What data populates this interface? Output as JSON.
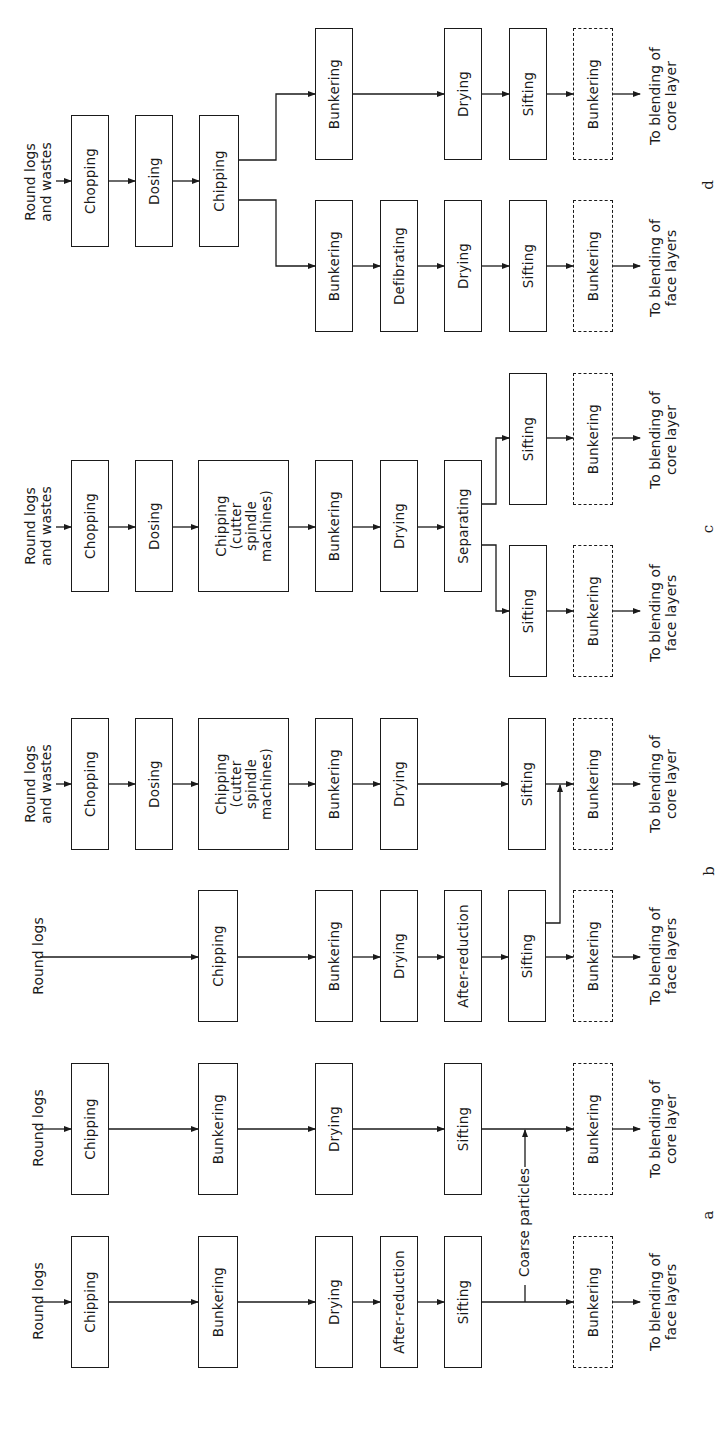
{
  "figure": {
    "orientation": "rotated 90 degrees counter-clockwise",
    "panels": [
      {
        "id": "a",
        "label": "a",
        "lanes": [
          {
            "input": "Round logs",
            "steps": [
              "Chipping",
              "Bunkering",
              "Drying",
              "Sifting",
              "Bunkering"
            ],
            "output": "To blending of core layer"
          },
          {
            "input": "Round logs",
            "steps": [
              "Chipping",
              "Bunkering",
              "Drying",
              "After-reduction",
              "Sifting",
              "Bunkering"
            ],
            "output": "To blending of face layers"
          }
        ],
        "annotation": "Coarse particles"
      },
      {
        "id": "b",
        "label": "b",
        "lanes": [
          {
            "input": "Round logs and wastes",
            "steps": [
              "Chopping",
              "Dosing",
              "Chipping (cutter spindle machines)",
              "Bunkering",
              "Drying",
              "Sifting",
              "Bunkering"
            ],
            "output": "To blending of core layer"
          },
          {
            "input": "Round logs",
            "steps": [
              "Chipping",
              "Bunkering",
              "Drying",
              "After-reduction",
              "Sifting",
              "Bunkering"
            ],
            "output": "To blending of face layers"
          }
        ]
      },
      {
        "id": "c",
        "label": "c",
        "shared_steps": [
          "Chopping",
          "Dosing",
          "Chipping (cutter spindle machines)",
          "Bunkering",
          "Drying",
          "Separating"
        ],
        "input": "Round logs and wastes",
        "lanes": [
          {
            "steps": [
              "Sifting",
              "Bunkering"
            ],
            "output": "To blending of core layer"
          },
          {
            "steps": [
              "Sifting",
              "Bunkering"
            ],
            "output": "To blending of face layers"
          }
        ]
      },
      {
        "id": "d",
        "label": "d",
        "shared_steps": [
          "Chopping",
          "Dosing",
          "Chipping"
        ],
        "input": "Round logs and wastes",
        "lanes": [
          {
            "steps": [
              "Bunkering",
              "Drying",
              "Sifting",
              "Bunkering"
            ],
            "output": "To blending of core layer"
          },
          {
            "steps": [
              "Bunkering",
              "Defibrating",
              "Drying",
              "Sifting",
              "Bunkering"
            ],
            "output": "To blending of face layers"
          }
        ]
      }
    ]
  },
  "text": {
    "round_logs": "Round logs",
    "round_logs_wastes_1": "Round logs",
    "round_logs_wastes_2": "and wastes",
    "chopping": "Chopping",
    "dosing": "Dosing",
    "chipping": "Chipping",
    "chipping_csm_1": "Chipping",
    "chipping_csm_2": "(cutter",
    "chipping_csm_3": "spindle",
    "chipping_csm_4": "machines)",
    "bunkering": "Bunkering",
    "drying": "Drying",
    "sifting": "Sifting",
    "after_reduction": "After-reduction",
    "separating": "Separating",
    "defibrating": "Defibrating",
    "coarse_particles": "Coarse particles",
    "out_core_1": "To blending of",
    "out_core_2": "core layer",
    "out_face_1": "To blending of",
    "out_face_2": "face layers",
    "letter_a": "a",
    "letter_b": "b",
    "letter_c": "c",
    "letter_d": "d"
  }
}
